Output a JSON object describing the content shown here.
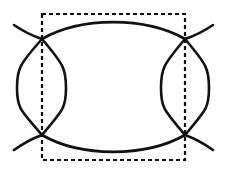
{
  "figure": {
    "background_color": "#ffffff",
    "stroke_color": "#111111",
    "canvas": {
      "width": 225,
      "height": 177
    },
    "dashed_rect": {
      "name": "fundamental-domain-rectangle",
      "x": 42,
      "y": 14,
      "width": 143,
      "height": 146,
      "dash_pattern": "4 3",
      "stroke_width": 2.2
    },
    "nodes": [
      {
        "name": "node-top-left",
        "x": 42,
        "y": 39
      },
      {
        "name": "node-top-right",
        "x": 185,
        "y": 39
      },
      {
        "name": "node-bottom-left",
        "x": 42,
        "y": 135
      },
      {
        "name": "node-bottom-right",
        "x": 185,
        "y": 135
      }
    ],
    "left_lens": {
      "name": "left-lens",
      "top_x": 42,
      "top_y": 39,
      "bottom_x": 42,
      "bottom_y": 135,
      "left_extreme_x": 17,
      "right_extreme_x": 66,
      "mid_y": 88,
      "stroke_width": 2.6
    },
    "right_lens": {
      "name": "right-lens",
      "top_x": 185,
      "top_y": 39,
      "bottom_x": 185,
      "bottom_y": 135,
      "left_extreme_x": 161,
      "right_extreme_x": 209,
      "mid_y": 88,
      "stroke_width": 2.6
    },
    "top_arc": {
      "name": "top-connecting-arc",
      "start_x": 42,
      "start_y": 39,
      "end_x": 185,
      "end_y": 39,
      "apex_x": 113,
      "apex_y": 22,
      "stroke_width": 2.8
    },
    "bottom_arc": {
      "name": "bottom-connecting-arc",
      "start_x": 42,
      "start_y": 135,
      "end_x": 185,
      "end_y": 135,
      "apex_x": 113,
      "apex_y": 152,
      "stroke_width": 2.8
    },
    "tails": [
      {
        "name": "tail-top-left",
        "from_x": 42,
        "from_y": 39,
        "to_x": 14,
        "to_y": 25
      },
      {
        "name": "tail-top-right",
        "from_x": 185,
        "from_y": 39,
        "to_x": 213,
        "to_y": 25
      },
      {
        "name": "tail-bottom-left",
        "from_x": 42,
        "from_y": 135,
        "to_x": 14,
        "to_y": 150
      },
      {
        "name": "tail-bottom-right",
        "from_x": 185,
        "from_y": 135,
        "to_x": 213,
        "to_y": 150
      }
    ]
  }
}
